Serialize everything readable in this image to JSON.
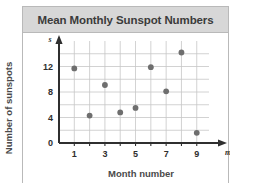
{
  "figure": {
    "title": "Mean Monthly Sunspot Numbers"
  },
  "chart_data": {
    "type": "scatter",
    "title": "Mean Monthly Sunspot Numbers",
    "xlabel": "Month number",
    "ylabel": "Number of sunspots",
    "x_axis_variable": "m",
    "y_axis_variable": "s",
    "x": [
      1,
      2,
      3,
      4,
      5,
      6,
      7,
      8,
      9
    ],
    "values": [
      11.7,
      4.3,
      9.1,
      4.8,
      5.5,
      11.9,
      8.1,
      14.2,
      1.6
    ],
    "points": [
      {
        "m": 1,
        "s": 11.7
      },
      {
        "m": 2,
        "s": 4.3
      },
      {
        "m": 3,
        "s": 9.1
      },
      {
        "m": 4,
        "s": 4.8
      },
      {
        "m": 5,
        "s": 5.5
      },
      {
        "m": 6,
        "s": 11.9
      },
      {
        "m": 7,
        "s": 8.1
      },
      {
        "m": 8,
        "s": 14.2
      },
      {
        "m": 9,
        "s": 1.6
      }
    ],
    "xlim": [
      0,
      9.8
    ],
    "ylim": [
      0,
      16
    ],
    "x_tick_values": [
      1,
      3,
      5,
      7,
      9
    ],
    "x_tick_labels": [
      "1",
      "3",
      "5",
      "7",
      "9"
    ],
    "x_minor_ticks": [
      1,
      2,
      3,
      4,
      5,
      6,
      7,
      8,
      9
    ],
    "y_tick_values": [
      0,
      4,
      8,
      12
    ],
    "y_tick_labels": [
      "0",
      "4",
      "8",
      "12"
    ],
    "y_gridlines": [
      2,
      4,
      6,
      8,
      10,
      12,
      14
    ],
    "grid": true,
    "legend": false,
    "marker_color": "#6e6e6e",
    "grid_color": "#c6c6c6",
    "axis_color": "#2f2f2f"
  },
  "style": {
    "header_background": "#d7d7d7",
    "frame_border": "#b9b9b9",
    "title_color": "#3b3b3b",
    "label_color": "#4a4a4a"
  }
}
